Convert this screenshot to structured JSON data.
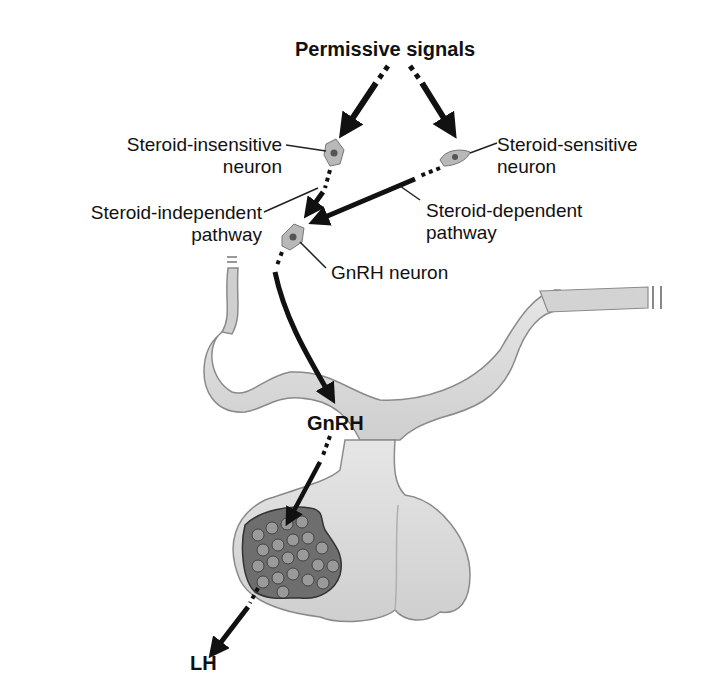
{
  "labels": {
    "permissive_signals": "Permissive signals",
    "steroid_insensitive_line1": "Steroid-insensitive",
    "steroid_insensitive_line2": "neuron",
    "steroid_sensitive_line1": "Steroid-sensitive",
    "steroid_sensitive_line2": "neuron",
    "steroid_independent_line1": "Steroid-independent",
    "steroid_independent_line2": "pathway",
    "steroid_dependent_line1": "Steroid-dependent",
    "steroid_dependent_line2": "pathway",
    "gnrh_neuron": "GnRH neuron",
    "gnrh": "GnRH",
    "lh": "LH"
  },
  "colors": {
    "arrow": "#111111",
    "tissue_fill": "#dcdcdc",
    "tissue_edge": "#8a8a8a",
    "cells_fill": "#6e6e6e",
    "neuron_fill": "#b8b8b8"
  }
}
